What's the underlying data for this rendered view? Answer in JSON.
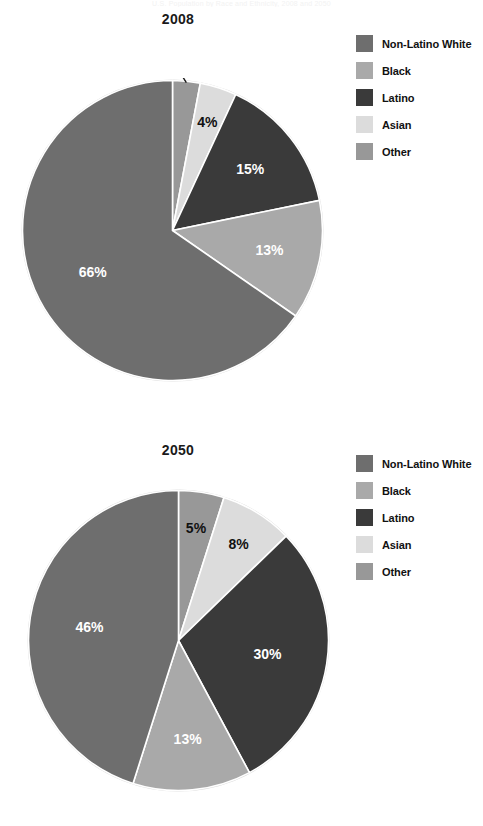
{
  "page": {
    "faint_header": "U.S. Population by Race and Ethnicity, 2008 and 2050"
  },
  "legend_labels": {
    "non_latino_white": "Non-Latino White",
    "black": "Black",
    "latino": "Latino",
    "asian": "Asian",
    "other": "Other"
  },
  "colors": {
    "non_latino_white": "#6e6e6e",
    "black": "#a9a9a9",
    "latino": "#3a3a3a",
    "asian": "#dcdcdc",
    "other": "#989898",
    "outline": "#ffffff",
    "rim": "#d8d8d8",
    "label_light": "#ffffff",
    "label_dark": "#111111"
  },
  "chart_data": [
    {
      "type": "pie",
      "title": "2008",
      "legend_position": "right",
      "start_angle_deg": 0,
      "direction": "clockwise",
      "labels": [
        "Other",
        "Asian",
        "Latino",
        "Black",
        "Non-Latino White"
      ],
      "values": [
        3,
        4,
        15,
        13,
        66
      ],
      "value_labels": [
        "3%",
        "4%",
        "15%",
        "13%",
        "66%"
      ],
      "colors": [
        "#989898",
        "#dcdcdc",
        "#3a3a3a",
        "#a9a9a9",
        "#6e6e6e"
      ],
      "label_placement": [
        "callout",
        "inside",
        "inside",
        "inside",
        "inside"
      ],
      "label_color": [
        "dark",
        "dark",
        "light",
        "light",
        "light"
      ]
    },
    {
      "type": "pie",
      "title": "2050",
      "legend_position": "right",
      "start_angle_deg": 0,
      "direction": "clockwise",
      "labels": [
        "Other",
        "Asian",
        "Latino",
        "Black",
        "Non-Latino White"
      ],
      "values": [
        5,
        8,
        30,
        13,
        46
      ],
      "value_labels": [
        "5%",
        "8%",
        "30%",
        "13%",
        "46%"
      ],
      "colors": [
        "#989898",
        "#dcdcdc",
        "#3a3a3a",
        "#a9a9a9",
        "#6e6e6e"
      ],
      "label_placement": [
        "inside",
        "inside",
        "inside",
        "inside",
        "inside"
      ],
      "label_color": [
        "dark",
        "dark",
        "light",
        "light",
        "light"
      ]
    }
  ]
}
